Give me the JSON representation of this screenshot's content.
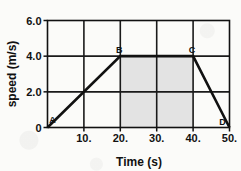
{
  "chart_data": {
    "type": "line",
    "title": "",
    "xlabel": "Time (s)",
    "ylabel": "speed (m/s)",
    "xlim": [
      0,
      50
    ],
    "ylim": [
      0,
      6
    ],
    "grid": true,
    "legend": "none",
    "x_ticks": [
      10,
      20,
      30,
      40,
      50
    ],
    "x_tick_labels": [
      "10.",
      "20.",
      "30.",
      "40.",
      "50."
    ],
    "y_ticks": [
      0,
      2,
      4,
      6
    ],
    "y_tick_labels": [
      "0",
      "2.0",
      "4.0",
      "6.0"
    ],
    "series": [
      {
        "name": "speed",
        "x": [
          0,
          20,
          40,
          50
        ],
        "y": [
          0,
          4.0,
          4.0,
          0
        ],
        "point_labels": [
          "A",
          "B",
          "C",
          "D"
        ]
      }
    ],
    "annotations": [
      {
        "label": "A",
        "x": 0,
        "y": 0,
        "note": "start of acceleration"
      },
      {
        "label": "B",
        "x": 20,
        "y": 4.0,
        "note": "start of constant speed"
      },
      {
        "label": "C",
        "x": 40,
        "y": 4.0,
        "note": "end of constant speed"
      },
      {
        "label": "D",
        "x": 50,
        "y": 0,
        "note": "end of deceleration"
      }
    ],
    "shaded_region": {
      "x_start": 20,
      "x_end": 40,
      "y_start": 0,
      "y_end": 4.0,
      "color": "#e3e3e3"
    },
    "colors": {
      "line": "#111111",
      "grid": "#1a1a1a",
      "axis": "#111111",
      "background": "#fbfbf9",
      "shade": "#e3e3e3"
    }
  }
}
